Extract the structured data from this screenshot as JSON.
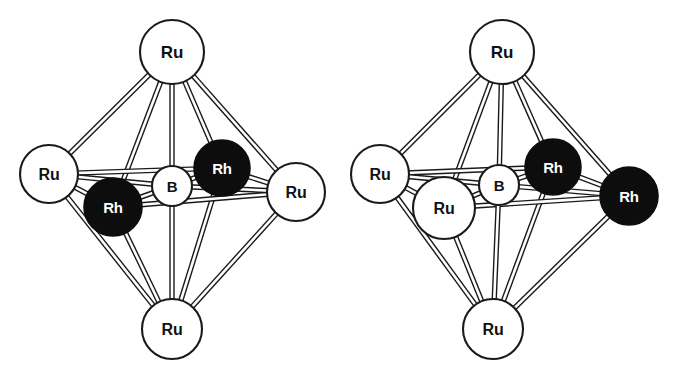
{
  "figure": {
    "title": "",
    "caption": "",
    "background_color": "#ffffff",
    "line_color": "#1a1a1a",
    "open_vertex_color": "#ffffff",
    "filled_vertex_color": "#0d0d0d",
    "open_label_color": "#111111",
    "filled_label_color": "#ffffff"
  },
  "chart_data": {
    "type": "diagram",
    "subtype": "molecular-cluster-ball-and-stick",
    "title": "",
    "xlabel": "",
    "ylabel": "",
    "panels": [
      {
        "id": "left",
        "name": "left-cluster",
        "geometry": "octahedron",
        "vertex_count": 6,
        "interstitial_count": 1,
        "formula_atoms": {
          "Ru": 4,
          "Rh": 2,
          "B": 1
        },
        "atoms": [
          {
            "id": "L-apex-top",
            "label": "Ru",
            "style": "open",
            "cx": 172,
            "cy": 52,
            "r": 32,
            "fs": 17
          },
          {
            "id": "L-eq-left",
            "label": "Ru",
            "style": "open",
            "cx": 49,
            "cy": 174,
            "r": 29,
            "fs": 16
          },
          {
            "id": "L-eq-front",
            "label": "Rh",
            "style": "filled",
            "cx": 113,
            "cy": 207,
            "r": 29,
            "fs": 15
          },
          {
            "id": "L-eq-back",
            "label": "Rh",
            "style": "filled",
            "cx": 222,
            "cy": 168,
            "r": 28,
            "fs": 15
          },
          {
            "id": "L-eq-right",
            "label": "Ru",
            "style": "open",
            "cx": 296,
            "cy": 192,
            "r": 29,
            "fs": 16
          },
          {
            "id": "L-apex-bot",
            "label": "Ru",
            "style": "open",
            "cx": 172,
            "cy": 329,
            "r": 30,
            "fs": 16
          },
          {
            "id": "L-center",
            "label": "B",
            "style": "open",
            "cx": 172,
            "cy": 186,
            "r": 20,
            "fs": 15
          }
        ],
        "bonds": [
          [
            "L-apex-top",
            "L-eq-left"
          ],
          [
            "L-apex-top",
            "L-eq-front"
          ],
          [
            "L-apex-top",
            "L-eq-back"
          ],
          [
            "L-apex-top",
            "L-eq-right"
          ],
          [
            "L-apex-bot",
            "L-eq-left"
          ],
          [
            "L-apex-bot",
            "L-eq-front"
          ],
          [
            "L-apex-bot",
            "L-eq-back"
          ],
          [
            "L-apex-bot",
            "L-eq-right"
          ],
          [
            "L-eq-left",
            "L-eq-front"
          ],
          [
            "L-eq-front",
            "L-eq-right"
          ],
          [
            "L-eq-right",
            "L-eq-back"
          ],
          [
            "L-eq-back",
            "L-eq-left"
          ],
          [
            "L-center",
            "L-apex-top"
          ],
          [
            "L-center",
            "L-apex-bot"
          ],
          [
            "L-center",
            "L-eq-left"
          ],
          [
            "L-center",
            "L-eq-front"
          ],
          [
            "L-center",
            "L-eq-back"
          ],
          [
            "L-center",
            "L-eq-right"
          ]
        ]
      },
      {
        "id": "right",
        "name": "right-cluster",
        "geometry": "octahedron",
        "vertex_count": 6,
        "interstitial_count": 1,
        "formula_atoms": {
          "Ru": 4,
          "Rh": 2,
          "B": 1
        },
        "atoms": [
          {
            "id": "R-apex-top",
            "label": "Ru",
            "style": "open",
            "cx": 502,
            "cy": 52,
            "r": 32,
            "fs": 17
          },
          {
            "id": "R-eq-left",
            "label": "Ru",
            "style": "open",
            "cx": 380,
            "cy": 174,
            "r": 29,
            "fs": 16
          },
          {
            "id": "R-eq-front",
            "label": "Ru",
            "style": "open",
            "cx": 444,
            "cy": 208,
            "r": 31,
            "fs": 16
          },
          {
            "id": "R-eq-back",
            "label": "Rh",
            "style": "filled",
            "cx": 553,
            "cy": 167,
            "r": 28,
            "fs": 15
          },
          {
            "id": "R-eq-right",
            "label": "Rh",
            "style": "filled",
            "cx": 629,
            "cy": 196,
            "r": 29,
            "fs": 15
          },
          {
            "id": "R-apex-bot",
            "label": "Ru",
            "style": "open",
            "cx": 493,
            "cy": 329,
            "r": 30,
            "fs": 16
          },
          {
            "id": "R-center",
            "label": "B",
            "style": "open",
            "cx": 499,
            "cy": 185,
            "r": 20,
            "fs": 15
          }
        ],
        "bonds": [
          [
            "R-apex-top",
            "R-eq-left"
          ],
          [
            "R-apex-top",
            "R-eq-front"
          ],
          [
            "R-apex-top",
            "R-eq-back"
          ],
          [
            "R-apex-top",
            "R-eq-right"
          ],
          [
            "R-apex-bot",
            "R-eq-left"
          ],
          [
            "R-apex-bot",
            "R-eq-front"
          ],
          [
            "R-apex-bot",
            "R-eq-back"
          ],
          [
            "R-apex-bot",
            "R-eq-right"
          ],
          [
            "R-eq-left",
            "R-eq-front"
          ],
          [
            "R-eq-front",
            "R-eq-right"
          ],
          [
            "R-eq-right",
            "R-eq-back"
          ],
          [
            "R-eq-back",
            "R-eq-left"
          ],
          [
            "R-center",
            "R-apex-top"
          ],
          [
            "R-center",
            "R-apex-bot"
          ],
          [
            "R-center",
            "R-eq-left"
          ],
          [
            "R-center",
            "R-eq-front"
          ],
          [
            "R-center",
            "R-eq-back"
          ],
          [
            "R-center",
            "R-eq-right"
          ]
        ]
      }
    ],
    "legend": [
      {
        "symbol": "Ru",
        "style": "open",
        "meaning": "Ru"
      },
      {
        "symbol": "Rh",
        "style": "filled",
        "meaning": "Rh"
      },
      {
        "symbol": "B",
        "style": "open",
        "meaning": "B"
      }
    ]
  }
}
